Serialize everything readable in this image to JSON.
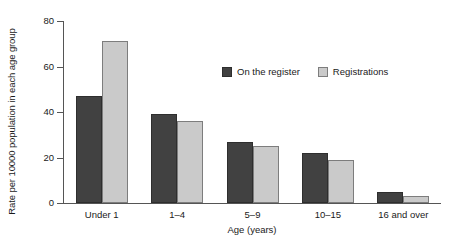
{
  "chart_data": {
    "type": "bar",
    "title": "",
    "xlabel": "Age (years)",
    "ylabel": "Rate per 10000 population in each age group",
    "categories": [
      "Under 1",
      "1–4",
      "5–9",
      "10–15",
      "16 and over"
    ],
    "series": [
      {
        "name": "On the register",
        "color": "#414141",
        "values": [
          47,
          39,
          27,
          22,
          5
        ]
      },
      {
        "name": "Registrations",
        "color": "#cacaca",
        "values": [
          71,
          36,
          25,
          19,
          3
        ]
      }
    ],
    "ylim": [
      0,
      80
    ],
    "yticks": [
      0,
      20,
      40,
      60,
      80
    ],
    "ytick_labels": [
      "0",
      "20",
      "40",
      "60",
      "80"
    ],
    "grid": false,
    "legend_position": "upper-center"
  }
}
